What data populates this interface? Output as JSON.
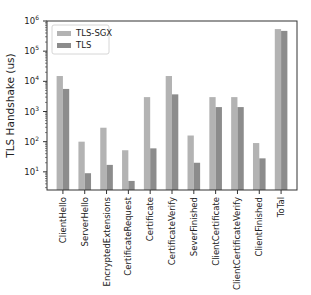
{
  "chart_data": {
    "type": "bar",
    "title": "",
    "xlabel": "",
    "ylabel": "TLS Handshake (us)",
    "yscale": "log",
    "ylim": [
      2.5,
      1000000
    ],
    "yticks": [
      10,
      100,
      1000,
      10000,
      100000,
      1000000
    ],
    "ytick_labels": [
      {
        "base": "10",
        "exp": "1"
      },
      {
        "base": "10",
        "exp": "2"
      },
      {
        "base": "10",
        "exp": "3"
      },
      {
        "base": "10",
        "exp": "4"
      },
      {
        "base": "10",
        "exp": "5"
      },
      {
        "base": "10",
        "exp": "6"
      }
    ],
    "grid": false,
    "legend_position": "upper left",
    "categories": [
      "ClientHello",
      "ServerHello",
      "EncryptedExtensions",
      "CertificateRequest",
      "Certificate",
      "CertificateVerify",
      "SeverFinished",
      "ClientCertificate",
      "ClientCertificateVerify",
      "ClientFinished",
      "ToTal"
    ],
    "series": [
      {
        "name": "TLS-SGX",
        "color": "#b3b3b3",
        "values": [
          15000,
          100,
          290,
          52,
          3000,
          15000,
          160,
          3000,
          3000,
          90,
          540000
        ]
      },
      {
        "name": "TLS",
        "color": "#8c8c8c",
        "values": [
          5600,
          9,
          17,
          5,
          60,
          3700,
          20,
          1400,
          1400,
          28,
          470000
        ]
      }
    ]
  }
}
